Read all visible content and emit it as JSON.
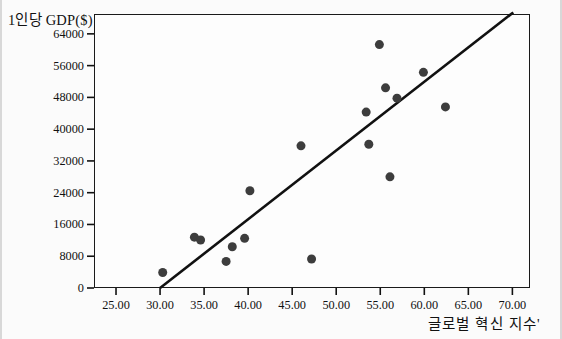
{
  "chart_data": {
    "type": "scatter",
    "title": "",
    "xlabel": "글로벌 혁신 지수'",
    "ylabel": "1인당 GDP($)",
    "xlim": [
      22.5,
      72.0
    ],
    "ylim": [
      0,
      69000
    ],
    "xticks": [
      25.0,
      30.0,
      35.0,
      40.0,
      45.0,
      50.0,
      55.0,
      60.0,
      65.0,
      70.0
    ],
    "xtick_labels": [
      "25.00",
      "30.00",
      "35.00",
      "40.00",
      "45.00",
      "50.00",
      "55.00",
      "60.00",
      "65.00",
      "70.00"
    ],
    "yticks": [
      0,
      8000,
      16000,
      24000,
      32000,
      40000,
      48000,
      56000,
      64000
    ],
    "ytick_labels": [
      "0",
      "8000",
      "16000",
      "24000",
      "32000",
      "40000",
      "48000",
      "56000",
      "64000"
    ],
    "grid": false,
    "legend": null,
    "marker_color": "#3d3d3d",
    "marker_size": 9,
    "line_color": "#111111",
    "points": [
      {
        "x": 30.3,
        "y": 3900
      },
      {
        "x": 33.9,
        "y": 12800
      },
      {
        "x": 34.6,
        "y": 12100
      },
      {
        "x": 37.5,
        "y": 6700
      },
      {
        "x": 38.2,
        "y": 10400
      },
      {
        "x": 39.6,
        "y": 12500
      },
      {
        "x": 40.2,
        "y": 24500
      },
      {
        "x": 46.0,
        "y": 35800
      },
      {
        "x": 47.2,
        "y": 7300
      },
      {
        "x": 53.4,
        "y": 44300
      },
      {
        "x": 53.7,
        "y": 36200
      },
      {
        "x": 54.9,
        "y": 61300
      },
      {
        "x": 55.6,
        "y": 50400
      },
      {
        "x": 56.1,
        "y": 28000
      },
      {
        "x": 56.9,
        "y": 47800
      },
      {
        "x": 59.9,
        "y": 54300
      },
      {
        "x": 62.4,
        "y": 45600
      }
    ],
    "trendline": {
      "label": "regression-line",
      "x_start": 30.0,
      "y_start": 0,
      "x_end": 70.1,
      "y_end": 69400
    }
  }
}
